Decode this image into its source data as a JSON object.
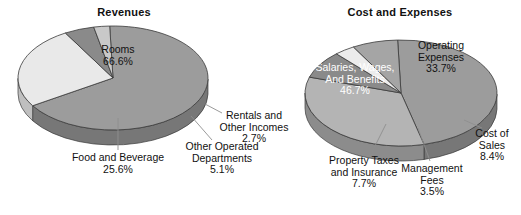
{
  "page": {
    "background": "#ffffff",
    "width": 521,
    "height": 215
  },
  "charts": [
    {
      "id": "revenues-pie",
      "title": "Revenues",
      "title_pos": {
        "x": 124,
        "y": 6
      },
      "center": {
        "x": 113,
        "y": 78
      },
      "radius_x": 95,
      "radius_y": 52,
      "depth": 15,
      "start_angle": 268,
      "slices": [
        {
          "name": "Rooms",
          "value": 66.6,
          "label": "Rooms",
          "pct_text": "66.6%",
          "color": "#9c9c9c",
          "side_color": "#777777",
          "explode": 0
        },
        {
          "name": "Food and Beverage",
          "value": 25.6,
          "label": "Food and Beverage",
          "pct_text": "25.6%",
          "color": "#e9e9e9",
          "side_color": "#bfbfbf",
          "explode": 0
        },
        {
          "name": "Other Operated Departments",
          "value": 5.1,
          "label": "Other Operated Departments",
          "pct_text": "5.1%",
          "color": "#8a8a8a",
          "side_color": "#6a6a6a",
          "explode": 0
        },
        {
          "name": "Rentals and Other Incomes",
          "value": 2.7,
          "label": "Rentals and Other Incomes",
          "pct_text": "2.7%",
          "color": "#c9c9c9",
          "side_color": "#9a9a9a",
          "explode": 0
        }
      ],
      "labels": [
        {
          "for": "Rooms",
          "lines": [
            "Rooms",
            "66.6%"
          ],
          "x": 118,
          "y": 44,
          "inverted": false,
          "leader": null
        },
        {
          "for": "Food and Beverage",
          "lines": [
            "Food and Beverage",
            "25.6%"
          ],
          "x": 118,
          "y": 152,
          "inverted": false,
          "leader": {
            "x1": 118,
            "y1": 118,
            "x2": 118,
            "y2": 150
          }
        },
        {
          "for": "Other Operated Departments",
          "lines": [
            "Other Operated",
            "Departments",
            "5.1%"
          ],
          "x": 222,
          "y": 141,
          "inverted": false,
          "leader": {
            "x1": 191,
            "y1": 116,
            "x2": 212,
            "y2": 140
          }
        },
        {
          "for": "Rentals and Other Incomes",
          "lines": [
            "Rentals and",
            "Other Incomes",
            "2.7%"
          ],
          "x": 254,
          "y": 110,
          "inverted": false,
          "leader": {
            "x1": 205,
            "y1": 104,
            "x2": 222,
            "y2": 113
          }
        }
      ]
    },
    {
      "id": "cost-and-expenses-pie",
      "title": "Cost and Expenses",
      "title_pos": {
        "x": 400,
        "y": 6
      },
      "center": {
        "x": 401,
        "y": 93
      },
      "radius_x": 96,
      "radius_y": 53,
      "depth": 15,
      "start_angle": 268,
      "slices": [
        {
          "name": "Salaries, Wages, And Benefits",
          "value": 46.7,
          "label": "Salaries, Wages, And Benefits",
          "pct_text": "46.7%",
          "color": "#9c9c9c",
          "side_color": "#777777",
          "explode": 0
        },
        {
          "name": "Operating Expenses",
          "value": 33.7,
          "label": "Operating Expenses",
          "pct_text": "33.7%",
          "color": "#b4b4b4",
          "side_color": "#8c8c8c",
          "explode": 0
        },
        {
          "name": "Cost of Sales",
          "value": 8.4,
          "label": "Cost of Sales",
          "pct_text": "8.4%",
          "color": "#8a8a8a",
          "side_color": "#6a6a6a",
          "explode": 0
        },
        {
          "name": "Management Fees",
          "value": 3.5,
          "label": "Management Fees",
          "pct_text": "3.5%",
          "color": "#ececec",
          "side_color": "#c2c2c2",
          "explode": 0
        },
        {
          "name": "Property Taxes and Insurance",
          "value": 7.7,
          "label": "Property Taxes and Insurance",
          "pct_text": "7.7%",
          "color": "#a5a5a5",
          "side_color": "#808080",
          "explode": 0
        }
      ],
      "labels": [
        {
          "for": "Salaries, Wages, And Benefits",
          "lines": [
            "Salaries, Wages,",
            "And Benefits",
            "46.7%"
          ],
          "x": 355,
          "y": 62,
          "inverted": true,
          "leader": null
        },
        {
          "for": "Operating Expenses",
          "lines": [
            "Operating",
            "Expenses",
            "33.7%"
          ],
          "x": 441,
          "y": 40,
          "inverted": false,
          "leader": null
        },
        {
          "for": "Cost of Sales",
          "lines": [
            "Cost of",
            "Sales",
            "8.4%"
          ],
          "x": 492,
          "y": 128,
          "inverted": false,
          "leader": {
            "x1": 464,
            "y1": 120,
            "x2": 482,
            "y2": 128
          }
        },
        {
          "for": "Management Fees",
          "lines": [
            "Management",
            "Fees",
            "3.5%"
          ],
          "x": 432,
          "y": 163,
          "inverted": false,
          "leader": {
            "x1": 418,
            "y1": 128,
            "x2": 430,
            "y2": 161
          }
        },
        {
          "for": "Property Taxes and Insurance",
          "lines": [
            "Property Taxes",
            "and Insurance",
            "7.7%"
          ],
          "x": 364,
          "y": 155,
          "inverted": false,
          "leader": {
            "x1": 386,
            "y1": 124,
            "x2": 372,
            "y2": 152
          }
        }
      ]
    }
  ],
  "chart_data": [
    {
      "type": "pie",
      "title": "Revenues",
      "categories": [
        "Rooms",
        "Food and Beverage",
        "Other Operated Departments",
        "Rentals and Other Incomes"
      ],
      "values": [
        66.6,
        25.6,
        5.1,
        2.7
      ],
      "value_labels": [
        "66.6%",
        "25.6%",
        "5.1%",
        "2.7%"
      ],
      "units": "percent",
      "total": 100.0,
      "legend": "none",
      "labels_position": "callout",
      "three_d": true
    },
    {
      "type": "pie",
      "title": "Cost and Expenses",
      "categories": [
        "Salaries, Wages, And Benefits",
        "Operating Expenses",
        "Cost of Sales",
        "Management Fees",
        "Property Taxes and Insurance"
      ],
      "values": [
        46.7,
        33.7,
        8.4,
        3.5,
        7.7
      ],
      "value_labels": [
        "46.7%",
        "33.7%",
        "8.4%",
        "3.5%",
        "7.7%"
      ],
      "units": "percent",
      "total": 100.0,
      "legend": "none",
      "labels_position": "callout",
      "three_d": true
    }
  ]
}
